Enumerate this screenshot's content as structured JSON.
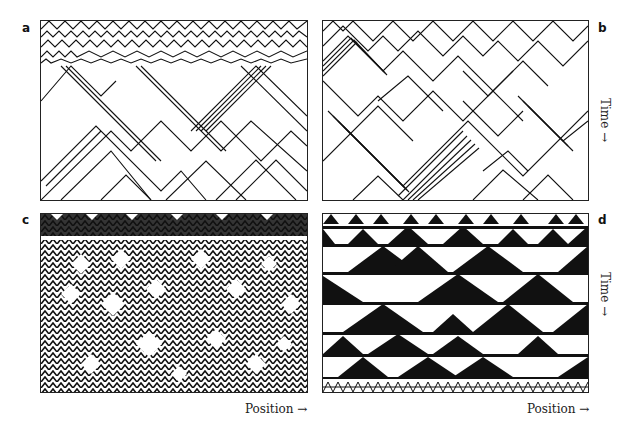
{
  "figure": {
    "panels": [
      {
        "id": "a",
        "label": "a",
        "style": "sparse lines",
        "description": "Cellular automaton evolution with dense initial region resolving into diagonal particle lines forming diamond patterns"
      },
      {
        "id": "b",
        "label": "b",
        "style": "sparse lines",
        "description": "Cellular automaton with bundles of parallel diagonal particle trajectories forming large V and diamond shapes"
      },
      {
        "id": "c",
        "label": "c",
        "style": "dense lines",
        "description": "Cellular automaton with dense interwoven diagonal structures and small white diamonds"
      },
      {
        "id": "d",
        "label": "d",
        "style": "filled triangles",
        "description": "Cellular automaton with large black and white nested triangles, Sierpinski-like detail at bottom"
      }
    ],
    "axes": {
      "x_label": "Position →",
      "y_label": "Time →"
    }
  }
}
